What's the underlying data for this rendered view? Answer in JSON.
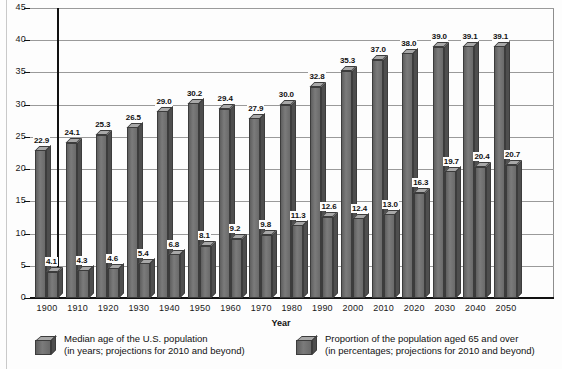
{
  "chart_data": {
    "type": "bar",
    "title": "",
    "xlabel": "Year",
    "ylabel": "",
    "ylim": [
      0,
      45
    ],
    "yticks": [
      0,
      5,
      10,
      15,
      20,
      25,
      30,
      35,
      40,
      45
    ],
    "grid": true,
    "legend_position": "bottom",
    "categories": [
      "1900",
      "1910",
      "1920",
      "1930",
      "1940",
      "1950",
      "1960",
      "1970",
      "1980",
      "1990",
      "2000",
      "2010",
      "2020",
      "2030",
      "2040",
      "2050"
    ],
    "series": [
      {
        "name": "Median age of the U.S. population",
        "values": [
          22.9,
          24.1,
          25.3,
          26.5,
          29.0,
          30.2,
          29.4,
          27.9,
          30.0,
          32.8,
          35.3,
          37.0,
          38.0,
          39.0,
          39.1,
          39.1
        ]
      },
      {
        "name": "Proportion of the population aged 65 and over",
        "values": [
          4.1,
          4.3,
          4.6,
          5.4,
          6.8,
          8.1,
          9.2,
          9.8,
          11.3,
          12.6,
          12.4,
          13.0,
          16.3,
          19.7,
          20.4,
          20.7
        ]
      }
    ]
  },
  "axis": {
    "x_title": "Year"
  },
  "legend": {
    "items": [
      {
        "line1": "Median age of the U.S. population",
        "line2": "(in years; projections for 2010 and beyond)"
      },
      {
        "line1": "Proportion of the population aged 65 and over",
        "line2": "(in percentages; projections for 2010 and beyond)"
      }
    ]
  },
  "colors": {
    "bar_front": "#6f6f6f",
    "bar_top": "#a8a8a8",
    "bar_side": "#4e4e4e",
    "gridline": "#9a9a9a",
    "axis": "#111111",
    "background": "#fdfdfd"
  }
}
